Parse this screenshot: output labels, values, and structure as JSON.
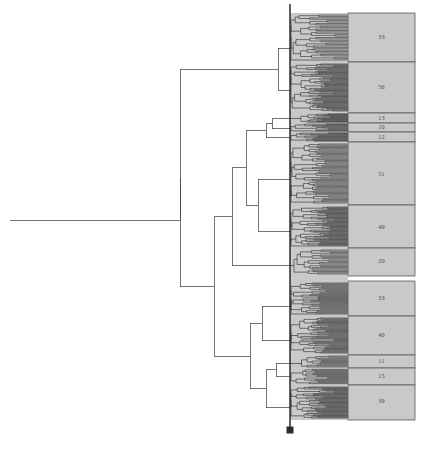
{
  "figure": {
    "kind": "dendrogram",
    "orientation": "horizontal-left-root",
    "background_color": "#ffffff",
    "line_color": "#3a3a3a",
    "tip_color": "#1a1a1a",
    "block_fill": "#c9c9c9",
    "block_stroke": "#595959",
    "cutline_color": "#2b2b2b",
    "marker_color": "#2b2b2b",
    "label_color": "#4a4a4a"
  },
  "cut": {
    "x": 290,
    "top_y": 4,
    "bottom_y": 432,
    "marker_y": 430,
    "marker_size": 7
  },
  "blocks": {
    "left": 348,
    "right": 415,
    "top": 13,
    "bottom": 420
  },
  "chart_data": {
    "type": "dendrogram",
    "title": "",
    "xlabel": "",
    "ylabel": "",
    "legend": [],
    "grid": false,
    "root": {
      "x": 10,
      "y": 220
    },
    "total_leaves": 382,
    "cluster_count": 13,
    "cluster_labels": [
      "33",
      "56",
      "13",
      "10",
      "12",
      "51",
      "49",
      "20",
      "33",
      "40",
      "11",
      "15",
      "39"
    ],
    "cluster_sizes": [
      33,
      56,
      13,
      10,
      12,
      51,
      49,
      20,
      33,
      40,
      11,
      15,
      39
    ],
    "clusters": [
      {
        "label": "33",
        "size": 33,
        "y_top": 13,
        "y_bottom": 62,
        "y_center": 37
      },
      {
        "label": "56",
        "size": 56,
        "y_top": 62,
        "y_bottom": 113,
        "y_center": 87
      },
      {
        "label": "13",
        "size": 13,
        "y_top": 113,
        "y_bottom": 123,
        "y_center": 118
      },
      {
        "label": "10",
        "size": 10,
        "y_top": 123,
        "y_bottom": 132,
        "y_center": 127
      },
      {
        "label": "12",
        "size": 12,
        "y_top": 132,
        "y_bottom": 142,
        "y_center": 137
      },
      {
        "label": "51",
        "size": 51,
        "y_top": 142,
        "y_bottom": 205,
        "y_center": 174
      },
      {
        "label": "49",
        "size": 49,
        "y_top": 205,
        "y_bottom": 248,
        "y_center": 227
      },
      {
        "label": "20",
        "size": 20,
        "y_top": 248,
        "y_bottom": 276,
        "y_center": 261
      },
      {
        "label": "33",
        "size": 33,
        "y_top": 281,
        "y_bottom": 316,
        "y_center": 298
      },
      {
        "label": "40",
        "size": 40,
        "y_top": 316,
        "y_bottom": 355,
        "y_center": 335
      },
      {
        "label": "11",
        "size": 11,
        "y_top": 355,
        "y_bottom": 368,
        "y_center": 361
      },
      {
        "label": "15",
        "size": 15,
        "y_top": 368,
        "y_bottom": 385,
        "y_center": 376
      },
      {
        "label": "39",
        "size": 39,
        "y_top": 385,
        "y_bottom": 420,
        "y_center": 401
      }
    ],
    "structure_note": "Root stem at left joins two primary subtrees; upper subtree contains clusters 33 and 56; lower subtree subdivides into the remaining eleven clusters."
  }
}
